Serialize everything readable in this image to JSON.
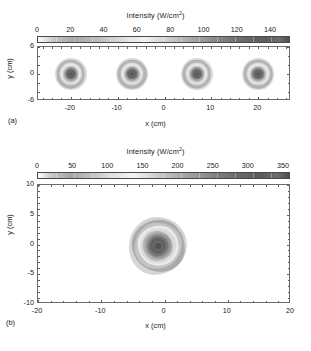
{
  "figure": {
    "background": "#ffffff",
    "ink": "#1a1a1a"
  },
  "chart_data": [
    {
      "id": "panel-a",
      "type": "heatmap",
      "panel_label": "(a)",
      "title": "",
      "colorbar": {
        "title_text": "Intensity (W/cm",
        "title_sup": "2",
        "title_tail": ")",
        "label": "Intensity (W/cm2)",
        "ticks": [
          0,
          20,
          40,
          60,
          80,
          100,
          120,
          140
        ],
        "tick_labels": [
          "0",
          "20",
          "40",
          "60",
          "80",
          "100",
          "120",
          "140"
        ],
        "range": [
          0,
          152
        ],
        "orientation": "horizontal",
        "position": "top",
        "colormap": "grayscale-jet",
        "stops": [
          {
            "p": 0,
            "c": "#ffffff"
          },
          {
            "p": 6,
            "c": "#c9c9c9"
          },
          {
            "p": 14,
            "c": "#a8a8a8"
          },
          {
            "p": 24,
            "c": "#bdbdbd"
          },
          {
            "p": 34,
            "c": "#dedede"
          },
          {
            "p": 42,
            "c": "#f2f2f2"
          },
          {
            "p": 50,
            "c": "#d6d6d6"
          },
          {
            "p": 58,
            "c": "#b4b4b4"
          },
          {
            "p": 66,
            "c": "#9a9a9a"
          },
          {
            "p": 74,
            "c": "#7e7e7e"
          },
          {
            "p": 82,
            "c": "#6a6a6a"
          },
          {
            "p": 90,
            "c": "#5c5c5c"
          },
          {
            "p": 96,
            "c": "#6d6d6d"
          },
          {
            "p": 100,
            "c": "#4f4f4f"
          }
        ]
      },
      "xlabel": "x (cm)",
      "ylabel": "y (cm)",
      "xlim": [
        -27,
        27
      ],
      "ylim": [
        -6,
        6
      ],
      "xticks": [
        -20,
        -10,
        0,
        10,
        20
      ],
      "xtick_labels": [
        "-20",
        "-10",
        "0",
        "10",
        "20"
      ],
      "yticks": [
        -6,
        0,
        6
      ],
      "ytick_labels": [
        "-6",
        "0",
        "6"
      ],
      "grid": false,
      "spots": [
        {
          "x": -20.0,
          "y": 0.0,
          "peak": 150,
          "radius_cm": 3.4
        },
        {
          "x": -6.9,
          "y": 0.0,
          "peak": 150,
          "radius_cm": 3.4
        },
        {
          "x": 6.9,
          "y": 0.0,
          "peak": 150,
          "radius_cm": 3.4
        },
        {
          "x": 20.0,
          "y": 0.0,
          "peak": 150,
          "radius_cm": 3.4
        }
      ]
    },
    {
      "id": "panel-b",
      "type": "heatmap",
      "panel_label": "(b)",
      "title": "",
      "colorbar": {
        "title_text": "Intensity (W/cm",
        "title_sup": "2",
        "title_tail": ")",
        "label": "Intensity (W/cm2)",
        "ticks": [
          0,
          50,
          100,
          150,
          200,
          250,
          300,
          350
        ],
        "tick_labels": [
          "0",
          "50",
          "100",
          "150",
          "200",
          "250",
          "300",
          "350"
        ],
        "range": [
          0,
          360
        ],
        "orientation": "horizontal",
        "position": "top",
        "colormap": "grayscale-jet",
        "stops": [
          {
            "p": 0,
            "c": "#ffffff"
          },
          {
            "p": 5,
            "c": "#cacaca"
          },
          {
            "p": 13,
            "c": "#a5a5a5"
          },
          {
            "p": 21,
            "c": "#c0c0c0"
          },
          {
            "p": 30,
            "c": "#e2e2e2"
          },
          {
            "p": 38,
            "c": "#f4f4f4"
          },
          {
            "p": 46,
            "c": "#d2d2d2"
          },
          {
            "p": 55,
            "c": "#b0b0b0"
          },
          {
            "p": 64,
            "c": "#969696"
          },
          {
            "p": 72,
            "c": "#7c7c7c"
          },
          {
            "p": 80,
            "c": "#686868"
          },
          {
            "p": 88,
            "c": "#5a5a5a"
          },
          {
            "p": 95,
            "c": "#6c6c6c"
          },
          {
            "p": 100,
            "c": "#4d4d4d"
          }
        ]
      },
      "xlabel": "x (cm)",
      "ylabel": "y (cm)",
      "xlim": [
        -20,
        20
      ],
      "ylim": [
        -10,
        10
      ],
      "xticks": [
        -20,
        -10,
        0,
        10,
        20
      ],
      "xtick_labels": [
        "-20",
        "-10",
        "0",
        "10",
        "20"
      ],
      "yticks": [
        -10,
        -5,
        0,
        5,
        10
      ],
      "ytick_labels": [
        "-10",
        "-5",
        "0",
        "5",
        "10"
      ],
      "grid": false,
      "spots": [
        {
          "x": -1.0,
          "y": -0.2,
          "peak": 350,
          "radius_cm": 4.6
        }
      ]
    }
  ]
}
